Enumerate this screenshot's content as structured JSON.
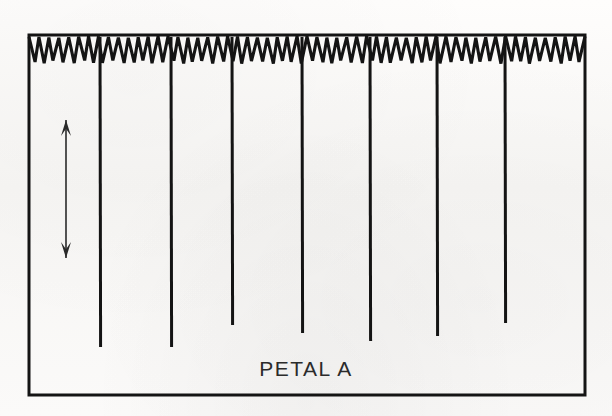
{
  "figure": {
    "title": "PETAL A",
    "caption": "PETAL A",
    "background_color": "#fbfaf8",
    "ink_color": "#141414"
  },
  "annotations": {
    "amplitude_arrow": {
      "name": "amplitude-scale-arrow",
      "style": "double-headed vertical arrow",
      "label": ""
    }
  },
  "chart_data": {
    "type": "line",
    "title": "PETAL A",
    "subtitle": "",
    "xlabel": "",
    "ylabel": "",
    "grid": false,
    "legend": false,
    "legend_position": "none",
    "xlim": [
      0,
      557
    ],
    "ylim": [
      0,
      360
    ],
    "axis_frame": {
      "left": 29,
      "top": 35,
      "right": 585,
      "bottom": 395,
      "stroke_width": 3,
      "color": "#141414"
    },
    "series": [
      {
        "name": "oscillation-band",
        "kind": "sawtooth",
        "teeth_count": 56,
        "period_px": 9.95,
        "baseline_y": 37,
        "trough_y": 62,
        "amplitude_px": 25,
        "x_start": 29,
        "x_end": 585,
        "stroke_width": 3.1
      },
      {
        "name": "deflection-spikes",
        "kind": "vertical-spikes",
        "count": 7,
        "top_y": 37,
        "stroke_width": 3.0,
        "x_positions": [
          100,
          171,
          232,
          302,
          370,
          437,
          505
        ],
        "bottom_y_values": [
          347,
          347,
          325,
          333,
          341,
          336,
          323
        ]
      }
    ],
    "scale_arrow": {
      "name": "amplitude-arrow",
      "x": 66,
      "y_top": 120,
      "y_bottom": 258,
      "heads": "both",
      "stroke_width": 1.6,
      "head_width": 10,
      "head_length": 16
    }
  }
}
